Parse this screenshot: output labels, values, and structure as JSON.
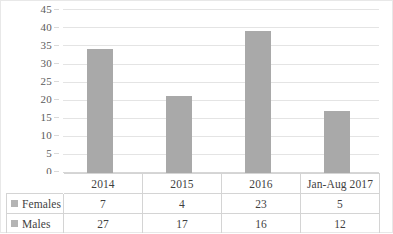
{
  "chart_data": {
    "type": "bar",
    "title": "",
    "xlabel": "",
    "ylabel": "",
    "ylim": [
      0,
      45
    ],
    "ytick_step": 5,
    "yticks": [
      45,
      40,
      35,
      30,
      25,
      20,
      15,
      10,
      5,
      0
    ],
    "grid": true,
    "legend_position": "data-table-left",
    "categories": [
      "2014",
      "2015",
      "2016",
      "Jan-Aug 2017"
    ],
    "values": [
      34,
      21,
      39,
      17
    ],
    "series": [
      {
        "name": "Females",
        "values": [
          7,
          4,
          23,
          5
        ]
      },
      {
        "name": "Males",
        "values": [
          27,
          17,
          16,
          12
        ]
      }
    ],
    "bar_color": "#a9a9a9",
    "gridline_color": "#e4e4e4",
    "note_totals": [
      34,
      21,
      39,
      17
    ]
  },
  "axis": {
    "y_labels": [
      "45",
      "40",
      "35",
      "30",
      "25",
      "20",
      "15",
      "10",
      "5",
      "0"
    ]
  },
  "table": {
    "categories": [
      "2014",
      "2015",
      "2016",
      "Jan-Aug 2017"
    ],
    "rows": [
      {
        "label": "Females",
        "values": [
          "7",
          "4",
          "23",
          "5"
        ]
      },
      {
        "label": "Males",
        "values": [
          "27",
          "17",
          "16",
          "12"
        ]
      }
    ]
  }
}
